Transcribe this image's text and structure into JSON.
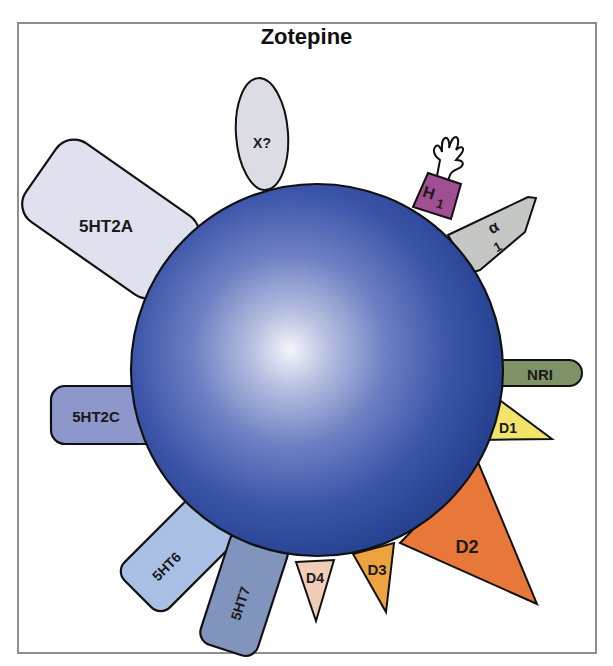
{
  "title": "Zotepine",
  "drug": {
    "name": "Zotepine",
    "shape": "sphere",
    "color": "#2f4aa0",
    "highlight_color": "#f2f4fb"
  },
  "receptors": [
    {
      "id": "x",
      "label": "X?",
      "shape": "ellipse",
      "color": "#dcdce4"
    },
    {
      "id": "h1",
      "label": "H",
      "subscript": "1",
      "shape": "box-with-hand",
      "color": "#a14f93"
    },
    {
      "id": "alpha1",
      "label": "α",
      "subscript": "1",
      "shape": "pentagon-arrow",
      "color": "#c4c7c4"
    },
    {
      "id": "nri",
      "label": "NRI",
      "shape": "rounded-bar",
      "color": "#7e9268"
    },
    {
      "id": "d1",
      "label": "D1",
      "shape": "triangle",
      "color": "#f4e36a"
    },
    {
      "id": "d2",
      "label": "D2",
      "shape": "triangle-large",
      "color": "#e8773a"
    },
    {
      "id": "d3",
      "label": "D3",
      "shape": "triangle",
      "color": "#eda440"
    },
    {
      "id": "d4",
      "label": "D4",
      "shape": "triangle",
      "color": "#f1cdb7"
    },
    {
      "id": "5ht7",
      "label": "5HT7",
      "shape": "rounded-rect",
      "color": "#8194bd"
    },
    {
      "id": "5ht6",
      "label": "5HT6",
      "shape": "rounded-rect",
      "color": "#a9c0e4"
    },
    {
      "id": "5ht2c",
      "label": "5HT2C",
      "shape": "rounded-rect",
      "color": "#8d97cc"
    },
    {
      "id": "5ht2a",
      "label": "5HT2A",
      "shape": "rounded-rect",
      "color": "#dfe2ee"
    }
  ],
  "labels": {
    "x": "X?",
    "h1_main": "H",
    "h1_sub": "1",
    "alpha1_main": "α",
    "alpha1_sub": "1",
    "nri": "NRI",
    "d1": "D1",
    "d2": "D2",
    "d3": "D3",
    "d4": "D4",
    "ht7": "5HT7",
    "ht6": "5HT6",
    "ht2c": "5HT2C",
    "ht2a": "5HT2A"
  }
}
